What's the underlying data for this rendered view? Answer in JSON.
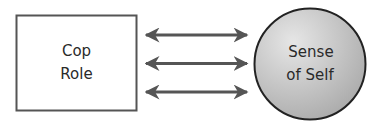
{
  "diagram": {
    "type": "relationship",
    "nodes": {
      "left": {
        "shape": "rectangle",
        "lines": [
          "Cop",
          "Role"
        ]
      },
      "right": {
        "shape": "circle",
        "lines": [
          "Sense",
          "of Self"
        ]
      }
    },
    "connections": [
      {
        "from": "left",
        "to": "right",
        "style": "bidirectional-arrow"
      },
      {
        "from": "left",
        "to": "right",
        "style": "bidirectional-arrow"
      },
      {
        "from": "left",
        "to": "right",
        "style": "bidirectional-arrow"
      }
    ],
    "colors": {
      "box_stroke": "#555555",
      "box_fill": "#ffffff",
      "arrow": "#555555",
      "circle_stroke": "#222222",
      "circle_light": "#e6e6e6",
      "circle_dark": "#a8a8a8",
      "text": "#2a2a2a"
    }
  }
}
